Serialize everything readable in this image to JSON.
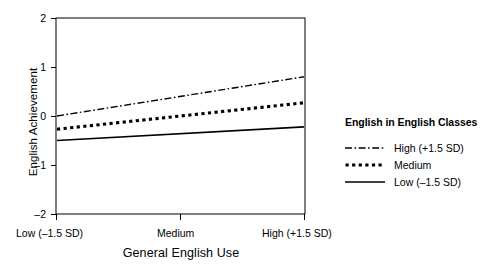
{
  "chart_data": {
    "type": "line",
    "title": "",
    "xlabel": "General English Use",
    "ylabel": "English Achievement",
    "ylim": [
      -2,
      2
    ],
    "yticks": [
      2,
      1,
      0,
      -1,
      -2
    ],
    "ytick_labels": [
      "2",
      "1",
      "0",
      "–1",
      "–2"
    ],
    "x": [
      -1.5,
      0,
      1.5
    ],
    "categories": [
      "Low (–1.5 SD)",
      "Medium",
      "High (+1.5 SD)"
    ],
    "grid": false,
    "legend_position": "right",
    "legend_title": "English in English Classes",
    "series": [
      {
        "name": "High (+1.5 SD)",
        "values": [
          0.0,
          0.4,
          0.8
        ],
        "style": "dash-dot",
        "color": "#000000"
      },
      {
        "name": "Medium",
        "values": [
          -0.27,
          0.0,
          0.27
        ],
        "style": "dotted",
        "color": "#000000"
      },
      {
        "name": "Low (–1.5 SD)",
        "values": [
          -0.5,
          -0.36,
          -0.22
        ],
        "style": "solid",
        "color": "#000000"
      }
    ]
  },
  "axes": {
    "y_title": "English Achievement",
    "x_title": "General English Use",
    "y_tick_labels": [
      "2",
      "1",
      "0",
      "–1",
      "–2"
    ],
    "x_tick_labels": [
      "Low (–1.5 SD)",
      "Medium",
      "High (+1.5 SD)"
    ]
  },
  "legend": {
    "title": "English in English Classes",
    "items": [
      {
        "label": "High (+1.5 SD)",
        "style": "dash-dot"
      },
      {
        "label": "Medium",
        "style": "dotted"
      },
      {
        "label": "Low (–1.5 SD)",
        "style": "solid"
      }
    ]
  },
  "colors": {
    "line": "#000000",
    "axis": "#000000",
    "background": "#ffffff"
  }
}
